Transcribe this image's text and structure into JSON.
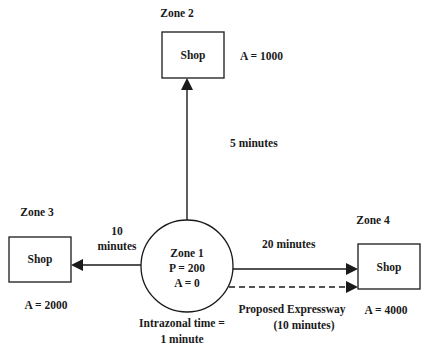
{
  "diagram": {
    "zone1": {
      "title": "Zone 1",
      "production": "P = 200",
      "attraction": "A = 0",
      "intrazonal_line1": "Intrazonal time =",
      "intrazonal_line2": "1 minute"
    },
    "zone2": {
      "title": "Zone 2",
      "shop_label": "Shop",
      "attraction": "A = 1000",
      "travel_time": "5 minutes"
    },
    "zone3": {
      "title": "Zone 3",
      "shop_label": "Shop",
      "attraction": "A = 2000",
      "travel_time_line1": "10",
      "travel_time_line2": "minutes"
    },
    "zone4": {
      "title": "Zone 4",
      "shop_label": "Shop",
      "attraction": "A = 4000",
      "travel_time": "20 minutes",
      "expressway_line1": "Proposed Expressway",
      "expressway_line2": "(10 minutes)"
    },
    "colors": {
      "stroke": "#1a1a1a",
      "background": "#ffffff"
    }
  }
}
